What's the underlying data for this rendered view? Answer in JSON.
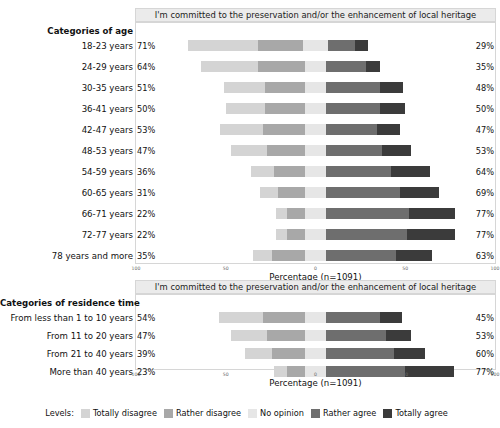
{
  "chart_data": {
    "type": "bar",
    "subtype": "diverging-stacked-likert",
    "title": "",
    "xlabel": "Percentage (n=1091)",
    "ylabel": "",
    "xlim": [
      -100,
      100
    ],
    "xticks": [
      -100,
      -50,
      0,
      50,
      100
    ],
    "xticklabels": [
      "100",
      "50",
      "0",
      "50",
      "100"
    ],
    "grid": false,
    "legend_position": "bottom",
    "legend_title": "Levels:",
    "levels": [
      "Totally disagree",
      "Rather disagree",
      "No opinion",
      "Rather agree",
      "Totally agree"
    ],
    "colors": [
      "#d4d4d4",
      "#a8a8a8",
      "#e6e6e6",
      "#6e6e6e",
      "#3b3b3b"
    ],
    "panels": [
      {
        "id": "age",
        "facet_title": "I'm committed to the preservation and/or the enhancement of local heritage",
        "group_header": "Categories of age",
        "axis_title": "Percentage (n=1091)",
        "categories": [
          "18-23 years",
          "24-29 years",
          "30-35 years",
          "36-41 years",
          "42-47 years",
          "48-53 years",
          "54-59 years",
          "60-65 years",
          "66-71 years",
          "72-77 years",
          "78 years and more"
        ],
        "left_totals": [
          "71%",
          "64%",
          "51%",
          "50%",
          "53%",
          "47%",
          "36%",
          "31%",
          "22%",
          "22%",
          "35%"
        ],
        "right_totals": [
          "29%",
          "35%",
          "48%",
          "50%",
          "47%",
          "53%",
          "64%",
          "69%",
          "77%",
          "77%",
          "63%"
        ],
        "rows": [
          {
            "category": "18-23 years",
            "values": [
              39,
              25,
              14,
              15,
              7
            ]
          },
          {
            "category": "24-29 years",
            "values": [
              32,
              26,
              12,
              22,
              8
            ]
          },
          {
            "category": "30-35 years",
            "values": [
              23,
              22,
              12,
              30,
              13
            ]
          },
          {
            "category": "36-41 years",
            "values": [
              22,
              22,
              12,
              30,
              14
            ]
          },
          {
            "category": "42-47 years",
            "values": [
              24,
              23,
              12,
              28,
              13
            ]
          },
          {
            "category": "48-53 years",
            "values": [
              20,
              21,
              12,
              31,
              16
            ]
          },
          {
            "category": "54-59 years",
            "values": [
              13,
              17,
              12,
              36,
              22
            ]
          },
          {
            "category": "60-65 years",
            "values": [
              10,
              15,
              12,
              41,
              22
            ]
          },
          {
            "category": "66-71 years",
            "values": [
              6,
              10,
              12,
              46,
              26
            ]
          },
          {
            "category": "72-77 years",
            "values": [
              6,
              10,
              12,
              45,
              27
            ]
          },
          {
            "category": "78 years and more",
            "values": [
              11,
              18,
              12,
              39,
              20
            ]
          }
        ]
      },
      {
        "id": "residence",
        "facet_title": "I'm committed to the preservation and/or the enhancement of local heritage",
        "group_header": "Categories of residence time",
        "axis_title": "Percentage (n=1091)",
        "categories": [
          "From less than 1 to 10 years",
          "From 11 to 20 years",
          "From 21 to 40 years",
          "More than 40 years"
        ],
        "left_totals": [
          "54%",
          "47%",
          "39%",
          "23%"
        ],
        "right_totals": [
          "45%",
          "53%",
          "60%",
          "77%"
        ],
        "rows": [
          {
            "category": "From less than 1 to 10 years",
            "values": [
              25,
              23,
              12,
              30,
              12
            ]
          },
          {
            "category": "From 11 to 20 years",
            "values": [
              20,
              21,
              12,
              33,
              14
            ]
          },
          {
            "category": "From 21 to 40 years",
            "values": [
              15,
              18,
              12,
              38,
              17
            ]
          },
          {
            "category": "More than 40 years",
            "values": [
              7,
              10,
              12,
              44,
              27
            ]
          }
        ]
      }
    ]
  }
}
